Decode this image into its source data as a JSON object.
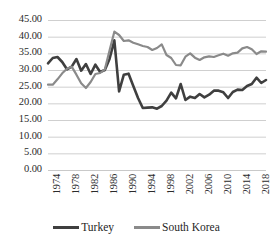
{
  "chart_data": {
    "type": "line",
    "title": "",
    "subtitle": "",
    "xlabel": "",
    "ylabel": "",
    "ylim": [
      0,
      45
    ],
    "ytick_labels": [
      "45.00",
      "40.00",
      "35.00",
      "30.00",
      "25.00",
      "20.00",
      "15.00",
      "10.00",
      "5.00",
      "0.00"
    ],
    "ytick_values": [
      45,
      40,
      35,
      30,
      25,
      20,
      15,
      10,
      5,
      0
    ],
    "xtick_labels": [
      "1974",
      "1978",
      "1982",
      "1986",
      "1990",
      "1994",
      "1998",
      "2002",
      "2006",
      "2010",
      "2014",
      "2018"
    ],
    "xtick_values": [
      1974,
      1978,
      1982,
      1986,
      1990,
      1994,
      1998,
      2002,
      2006,
      2010,
      2014,
      2018
    ],
    "xlim": [
      1974,
      2020
    ],
    "grid": "horizontal",
    "legend_position": "bottom",
    "x": [
      1974,
      1975,
      1976,
      1977,
      1978,
      1979,
      1980,
      1981,
      1982,
      1983,
      1984,
      1985,
      1986,
      1987,
      1988,
      1989,
      1990,
      1991,
      1992,
      1993,
      1994,
      1995,
      1996,
      1997,
      1998,
      1999,
      2000,
      2001,
      2002,
      2003,
      2004,
      2005,
      2006,
      2007,
      2008,
      2009,
      2010,
      2011,
      2012,
      2013,
      2014,
      2015,
      2016,
      2017,
      2018,
      2019,
      2020
    ],
    "series": [
      {
        "name": "Turkey",
        "color": "#3f3f3f",
        "values": [
          32.0,
          33.6,
          33.9,
          32.4,
          30.2,
          31.0,
          33.3,
          29.8,
          31.8,
          28.8,
          31.6,
          29.4,
          30.0,
          33.4,
          38.9,
          23.6,
          28.6,
          28.9,
          25.2,
          21.6,
          18.6,
          18.7,
          18.8,
          18.4,
          19.2,
          20.8,
          23.2,
          21.5,
          25.8,
          21.0,
          22.0,
          21.6,
          22.8,
          21.8,
          22.6,
          23.8,
          23.8,
          23.3,
          21.6,
          23.4,
          24.1,
          24.0,
          25.2,
          25.8,
          27.7,
          26.1,
          27.0
        ],
        "line_width": 2.6
      },
      {
        "name": "South Korea",
        "color": "#8a8a8a",
        "values": [
          25.6,
          25.6,
          27.2,
          29.0,
          30.4,
          31.0,
          28.6,
          26.0,
          24.6,
          26.4,
          28.8,
          29.1,
          30.2,
          35.9,
          41.5,
          40.5,
          38.7,
          38.9,
          38.2,
          37.7,
          37.2,
          36.9,
          36.0,
          36.6,
          37.7,
          34.5,
          33.6,
          31.5,
          31.4,
          34.0,
          35.0,
          33.7,
          33.0,
          33.8,
          34.1,
          33.9,
          34.4,
          34.9,
          34.3,
          35.0,
          35.2,
          36.5,
          36.9,
          36.2,
          34.8,
          35.6,
          35.5
        ],
        "line_width": 2.2
      }
    ]
  },
  "legend": {
    "entries": [
      {
        "label": "Turkey",
        "swatch": "turkey"
      },
      {
        "label": "South Korea",
        "swatch": "korea"
      }
    ]
  },
  "colors": {
    "turkey": "#3f3f3f",
    "south_korea": "#8a8a8a",
    "gridline": "#c9c9c9",
    "text": "#2b2b2b",
    "background": "#ffffff"
  }
}
